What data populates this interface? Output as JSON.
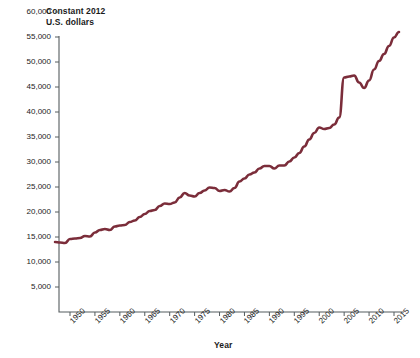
{
  "chart_data": {
    "type": "line",
    "title": "Constant 2012 U.S. dollars",
    "title_line1": "Constant 2012",
    "title_line2": "U.S. dollars",
    "xlabel": "Year",
    "ylabel": "",
    "xlim": [
      1947,
      2016
    ],
    "ylim": [
      0,
      60000
    ],
    "grid": false,
    "legend": null,
    "line_color": "#7B2D3A",
    "axis_color": "#555C5F",
    "y_ticks": [
      60000,
      55000,
      50000,
      45000,
      40000,
      35000,
      30000,
      25000,
      20000,
      15000,
      10000,
      5000
    ],
    "y_tick_labels": [
      "60,000",
      "55,000",
      "50,000",
      "45,000",
      "40,000",
      "35,000",
      "30,000",
      "25,000",
      "20,000",
      "15,000",
      "10,000",
      "5,000"
    ],
    "x_ticks": [
      1950,
      1955,
      1960,
      1965,
      1970,
      1975,
      1980,
      1985,
      1990,
      1995,
      2000,
      2005,
      2010,
      2015
    ],
    "x_tick_labels": [
      "1950",
      "1955",
      "1960",
      "1965",
      "1970",
      "1975",
      "1980",
      "1985",
      "1990",
      "1995",
      "2000",
      "2005",
      "2010",
      "2015"
    ],
    "x": [
      1947,
      1948,
      1949,
      1950,
      1951,
      1952,
      1953,
      1954,
      1955,
      1956,
      1957,
      1958,
      1959,
      1960,
      1961,
      1962,
      1963,
      1964,
      1965,
      1966,
      1967,
      1968,
      1969,
      1970,
      1971,
      1972,
      1973,
      1974,
      1975,
      1976,
      1977,
      1978,
      1979,
      1980,
      1981,
      1982,
      1983,
      1984,
      1985,
      1986,
      1987,
      1988,
      1989,
      1990,
      1991,
      1992,
      1993,
      1994,
      1995,
      1996,
      1997,
      1998,
      1999,
      2000,
      2001,
      2002,
      2003,
      2004,
      2005,
      2006,
      2007,
      2008,
      2009,
      2010,
      2011,
      2012,
      2013,
      2014,
      2015,
      2016
    ],
    "values": [
      14000,
      13900,
      13800,
      14600,
      14700,
      14800,
      15200,
      15100,
      15900,
      16400,
      16600,
      16400,
      17100,
      17300,
      17400,
      18000,
      18300,
      19000,
      19600,
      20200,
      20400,
      21200,
      21700,
      21600,
      21900,
      22900,
      23800,
      23300,
      23100,
      23800,
      24300,
      24900,
      24800,
      24200,
      24400,
      24100,
      24800,
      26100,
      26700,
      27500,
      27900,
      28700,
      29200,
      29200,
      28700,
      29300,
      29300,
      30100,
      30900,
      31800,
      33100,
      34500,
      35800,
      36900,
      36600,
      36800,
      37500,
      38900,
      46900,
      47100,
      47300,
      45900,
      44800,
      46300,
      48500,
      50200,
      51600,
      53200,
      54900,
      56000
    ],
    "annotations": []
  },
  "footnote": {
    "text": ""
  }
}
